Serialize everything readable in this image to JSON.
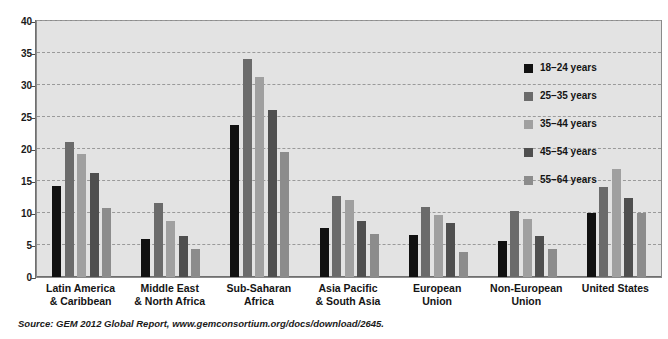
{
  "chart_data": {
    "type": "bar",
    "title": "",
    "subtitle": "",
    "xlabel": "",
    "ylabel": "",
    "ylim": [
      0,
      40
    ],
    "yticks": [
      0,
      5,
      10,
      15,
      20,
      25,
      30,
      35,
      40
    ],
    "ytick_labels": [
      "0",
      "5",
      "10",
      "15",
      "20",
      "25",
      "30",
      "35",
      "40"
    ],
    "grid": true,
    "legend_position": "inside-top-right",
    "categories": [
      "Latin America & Caribbean",
      "Middle East & North Africa",
      "Sub-Saharan Africa",
      "Asia Pacific & South Asia",
      "European Union",
      "Non-European Union",
      "United States"
    ],
    "category_lines": [
      [
        "Latin America",
        "& Caribbean"
      ],
      [
        "Middle East",
        "& North Africa"
      ],
      [
        "Sub-Saharan",
        "Africa"
      ],
      [
        "Asia Pacific",
        "& South Asia"
      ],
      [
        "European",
        "Union"
      ],
      [
        "Non-European",
        "Union"
      ],
      [
        "United States"
      ]
    ],
    "series": [
      {
        "name": "18–24 years",
        "color": "#111111",
        "values": [
          14.2,
          6.0,
          23.7,
          7.7,
          6.6,
          5.6,
          10.0
        ]
      },
      {
        "name": "25–35 years",
        "color": "#6b6b6b",
        "values": [
          21.1,
          11.5,
          34.0,
          12.7,
          11.0,
          10.3,
          14.0
        ]
      },
      {
        "name": "35–44 years",
        "color": "#a0a0a0",
        "values": [
          19.2,
          8.8,
          31.3,
          12.0,
          9.7,
          9.0,
          16.8
        ]
      },
      {
        "name": "45–54 years",
        "color": "#4f4f4f",
        "values": [
          16.3,
          6.4,
          26.1,
          8.7,
          8.4,
          6.4,
          12.3
        ]
      },
      {
        "name": "55–64 years",
        "color": "#8c8c8c",
        "values": [
          10.8,
          4.3,
          19.6,
          6.7,
          3.9,
          4.3,
          10.0
        ]
      }
    ],
    "source": {
      "prefix": "Source: GEM 2012 Global Report,",
      "url": "www.gemconsortium.org/docs/download/2645.",
      "full": "Source: GEM 2012 Global Report, www.gemconsortium.org/docs/download/2645."
    },
    "colors": {
      "plot_background": "#e3e3e3",
      "gridline": "#9a9a9a",
      "axis": "#6f6f6f",
      "text": "#141414",
      "page_background": "#ffffff"
    }
  }
}
